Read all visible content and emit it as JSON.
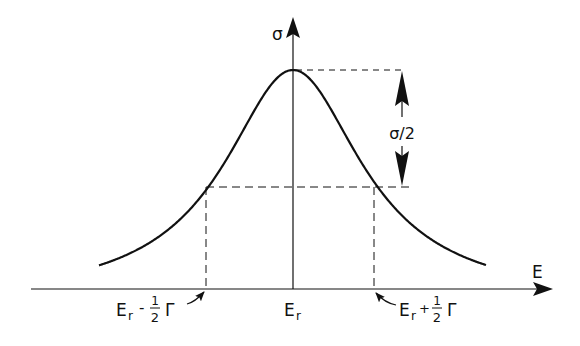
{
  "diagram": {
    "type": "resonance-curve",
    "colors": {
      "ink": "#111111",
      "background": "#ffffff"
    },
    "axes": {
      "x_label": "E",
      "y_label": "σ"
    },
    "curve": {
      "shape": "lorentzian",
      "peak_label": "E",
      "peak_label_sub": "r"
    },
    "half_height": {
      "label": "σ/2"
    },
    "left_half_point": {
      "main": "E",
      "sub": "r",
      "op": "-",
      "frac_num": "1",
      "frac_den": "2",
      "symbol": "Γ"
    },
    "right_half_point": {
      "main": "E",
      "sub": "r",
      "op": "+",
      "frac_num": "1",
      "frac_den": "2",
      "symbol": "Γ"
    }
  }
}
